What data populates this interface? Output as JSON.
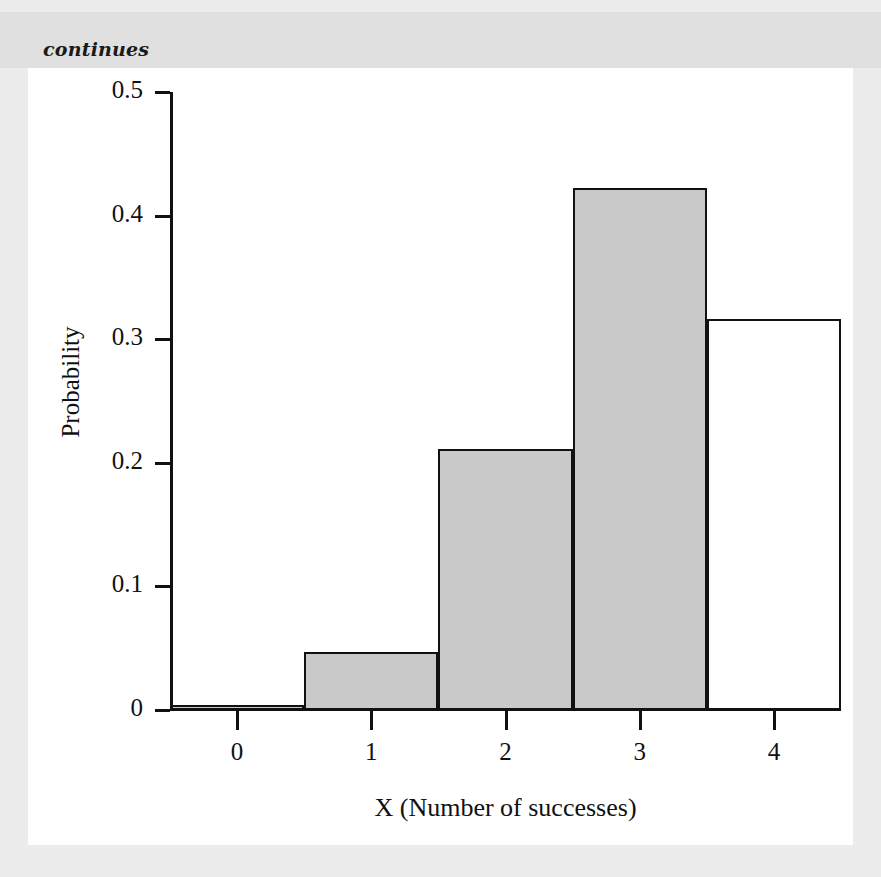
{
  "caption": {
    "text": "continues"
  },
  "colors": {
    "page_background": "#ececec",
    "caption_band": "#e0e0e0",
    "figure_background": "#ffffff",
    "bar_fill": "#c9c9c9",
    "bar_outline": "#111111",
    "axis": "#111111"
  },
  "chart_data": {
    "type": "bar",
    "title": "",
    "subtitle": "",
    "xlabel": "X (Number of successes)",
    "ylabel": "Probability",
    "categories": [
      "0",
      "1",
      "2",
      "3",
      "4"
    ],
    "values": [
      0.004,
      0.047,
      0.211,
      0.422,
      0.316
    ],
    "bar_styles": [
      "filled",
      "filled",
      "filled",
      "filled",
      "unfilled"
    ],
    "bin_edges": [
      -0.5,
      0.5,
      1.5,
      2.5,
      3.5,
      4.5
    ],
    "xlim": [
      -0.5,
      4.5
    ],
    "ylim": [
      0,
      0.5
    ],
    "xticks": [
      "0",
      "1",
      "2",
      "3",
      "4"
    ],
    "xtick_values": [
      0,
      1,
      2,
      3,
      4
    ],
    "yticks": [
      "0",
      "0.1",
      "0.2",
      "0.3",
      "0.4",
      "0.5"
    ],
    "ytick_values": [
      0,
      0.1,
      0.2,
      0.3,
      0.4,
      0.5
    ],
    "grid": false,
    "legend": null,
    "annotations": []
  }
}
